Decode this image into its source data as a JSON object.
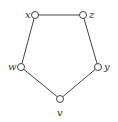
{
  "diagram": {
    "type": "graph",
    "nodes": [
      {
        "id": "x",
        "label": "x",
        "cx": 35,
        "cy": 15,
        "label_x": 25,
        "label_y": 18
      },
      {
        "id": "z",
        "label": "z",
        "cx": 83,
        "cy": 15,
        "label_x": 89,
        "label_y": 18
      },
      {
        "id": "w",
        "label": "w",
        "cx": 21,
        "cy": 67,
        "label_x": 8,
        "label_y": 70
      },
      {
        "id": "y",
        "label": "y",
        "cx": 98,
        "cy": 67,
        "label_x": 104,
        "label_y": 70
      },
      {
        "id": "v",
        "label": "v",
        "cx": 60,
        "cy": 99,
        "label_x": 57,
        "label_y": 116
      }
    ],
    "edges": [
      {
        "from": "x",
        "to": "z"
      },
      {
        "from": "z",
        "to": "y"
      },
      {
        "from": "y",
        "to": "v"
      },
      {
        "from": "v",
        "to": "w"
      },
      {
        "from": "w",
        "to": "x"
      }
    ],
    "colors": {
      "stroke": "#444444",
      "node_fill": "#ffffff",
      "label": "#333333"
    }
  }
}
